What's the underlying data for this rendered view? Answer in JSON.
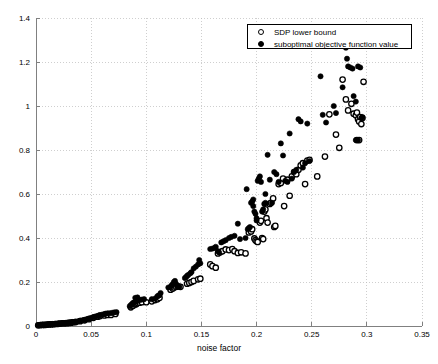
{
  "chart": {
    "type": "scatter",
    "title": "",
    "xlabel": "noise factor",
    "ylabel": "",
    "xlim": [
      0,
      0.35
    ],
    "ylim": [
      0,
      1.4
    ],
    "xticks": [
      "0",
      "0.05",
      "0.1",
      "0.15",
      "0.2",
      "0.25",
      "0.3",
      "0.35"
    ],
    "xtick_values": [
      0,
      0.05,
      0.1,
      0.15,
      0.2,
      0.25,
      0.3,
      0.35
    ],
    "yticks": [
      "0",
      "0.2",
      "0.4",
      "0.6",
      "0.8",
      "1",
      "1.2",
      "1.4"
    ],
    "ytick_values": [
      0,
      0.2,
      0.4,
      0.6,
      0.8,
      1,
      1.2,
      1.4
    ],
    "grid": true,
    "grid_style": "dotted",
    "grid_color": "#bbbbbb",
    "axis_color": "#808080",
    "marker_color": "#000000",
    "legend_position": "top-right"
  },
  "legend": {
    "items": [
      {
        "label": "SDP lower bound",
        "marker": "open-circle"
      },
      {
        "label": "suboptimal objective function value",
        "marker": "filled-circle"
      }
    ]
  },
  "chart_data": {
    "type": "scatter",
    "title": "",
    "xlabel": "noise factor",
    "ylabel": "",
    "xlim": [
      0,
      0.35
    ],
    "ylim": [
      0,
      1.4
    ],
    "xticks": [
      0,
      0.05,
      0.1,
      0.15,
      0.2,
      0.25,
      0.3,
      0.35
    ],
    "yticks": [
      0,
      0.2,
      0.4,
      0.6,
      0.8,
      1,
      1.2,
      1.4
    ],
    "grid": true,
    "legend_position": "top-right",
    "series": [
      {
        "name": "suboptimal objective function value",
        "marker": "filled-circle",
        "color": "#000000",
        "points": [
          [
            0.002,
            0.004
          ],
          [
            0.004,
            0.005
          ],
          [
            0.006,
            0.006
          ],
          [
            0.008,
            0.006
          ],
          [
            0.01,
            0.007
          ],
          [
            0.012,
            0.008
          ],
          [
            0.013,
            0.008
          ],
          [
            0.015,
            0.009
          ],
          [
            0.017,
            0.01
          ],
          [
            0.018,
            0.01
          ],
          [
            0.02,
            0.011
          ],
          [
            0.021,
            0.012
          ],
          [
            0.023,
            0.012
          ],
          [
            0.024,
            0.013
          ],
          [
            0.026,
            0.013
          ],
          [
            0.027,
            0.014
          ],
          [
            0.029,
            0.015
          ],
          [
            0.03,
            0.016
          ],
          [
            0.032,
            0.017
          ],
          [
            0.033,
            0.018
          ],
          [
            0.035,
            0.019
          ],
          [
            0.036,
            0.02
          ],
          [
            0.038,
            0.021
          ],
          [
            0.04,
            0.024
          ],
          [
            0.042,
            0.026
          ],
          [
            0.044,
            0.028
          ],
          [
            0.046,
            0.031
          ],
          [
            0.048,
            0.034
          ],
          [
            0.05,
            0.037
          ],
          [
            0.052,
            0.04
          ],
          [
            0.053,
            0.042
          ],
          [
            0.055,
            0.045
          ],
          [
            0.057,
            0.048
          ],
          [
            0.058,
            0.05
          ],
          [
            0.06,
            0.052
          ],
          [
            0.062,
            0.054
          ],
          [
            0.063,
            0.056
          ],
          [
            0.065,
            0.058
          ],
          [
            0.067,
            0.058
          ],
          [
            0.069,
            0.06
          ],
          [
            0.071,
            0.062
          ],
          [
            0.073,
            0.063
          ],
          [
            0.085,
            0.09
          ],
          [
            0.086,
            0.095
          ],
          [
            0.087,
            0.1
          ],
          [
            0.088,
            0.105
          ],
          [
            0.089,
            0.107
          ],
          [
            0.09,
            0.11
          ],
          [
            0.091,
            0.112
          ],
          [
            0.092,
            0.115
          ],
          [
            0.09,
            0.128
          ],
          [
            0.092,
            0.13
          ],
          [
            0.094,
            0.118
          ],
          [
            0.096,
            0.12
          ],
          [
            0.098,
            0.122
          ],
          [
            0.105,
            0.122
          ],
          [
            0.108,
            0.125
          ],
          [
            0.11,
            0.135
          ],
          [
            0.111,
            0.138
          ],
          [
            0.112,
            0.14
          ],
          [
            0.113,
            0.15
          ],
          [
            0.12,
            0.175
          ],
          [
            0.122,
            0.178
          ],
          [
            0.123,
            0.185
          ],
          [
            0.124,
            0.19
          ],
          [
            0.125,
            0.2
          ],
          [
            0.126,
            0.205
          ],
          [
            0.127,
            0.192
          ],
          [
            0.128,
            0.18
          ],
          [
            0.13,
            0.178
          ],
          [
            0.135,
            0.218
          ],
          [
            0.136,
            0.222
          ],
          [
            0.137,
            0.228
          ],
          [
            0.138,
            0.232
          ],
          [
            0.14,
            0.24
          ],
          [
            0.141,
            0.245
          ],
          [
            0.143,
            0.262
          ],
          [
            0.145,
            0.27
          ],
          [
            0.147,
            0.28
          ],
          [
            0.149,
            0.285
          ],
          [
            0.148,
            0.3
          ],
          [
            0.158,
            0.35
          ],
          [
            0.16,
            0.352
          ],
          [
            0.162,
            0.355
          ],
          [
            0.163,
            0.36
          ],
          [
            0.165,
            0.34
          ],
          [
            0.166,
            0.335
          ],
          [
            0.168,
            0.38
          ],
          [
            0.17,
            0.385
          ],
          [
            0.172,
            0.39
          ],
          [
            0.175,
            0.4
          ],
          [
            0.177,
            0.405
          ],
          [
            0.18,
            0.41
          ],
          [
            0.183,
            0.465
          ],
          [
            0.185,
            0.395
          ],
          [
            0.19,
            0.4
          ],
          [
            0.191,
            0.622
          ],
          [
            0.192,
            0.44
          ],
          [
            0.193,
            0.445
          ],
          [
            0.194,
            0.45
          ],
          [
            0.195,
            0.56
          ],
          [
            0.196,
            0.565
          ],
          [
            0.197,
            0.575
          ],
          [
            0.197,
            0.545
          ],
          [
            0.198,
            0.52
          ],
          [
            0.199,
            0.51
          ],
          [
            0.2,
            0.48
          ],
          [
            0.2,
            0.49
          ],
          [
            0.201,
            0.66
          ],
          [
            0.202,
            0.67
          ],
          [
            0.203,
            0.68
          ],
          [
            0.204,
            0.655
          ],
          [
            0.205,
            0.52
          ],
          [
            0.206,
            0.53
          ],
          [
            0.207,
            0.555
          ],
          [
            0.208,
            0.56
          ],
          [
            0.208,
            0.6
          ],
          [
            0.21,
            0.778
          ],
          [
            0.212,
            0.665
          ],
          [
            0.214,
            0.56
          ],
          [
            0.216,
            0.7
          ],
          [
            0.218,
            0.69
          ],
          [
            0.22,
            0.655
          ],
          [
            0.222,
            0.83
          ],
          [
            0.224,
            0.775
          ],
          [
            0.226,
            0.66
          ],
          [
            0.228,
            0.655
          ],
          [
            0.23,
            0.875
          ],
          [
            0.232,
            0.67
          ],
          [
            0.234,
            0.7
          ],
          [
            0.236,
            0.71
          ],
          [
            0.238,
            0.94
          ],
          [
            0.24,
            0.93
          ],
          [
            0.242,
            0.72
          ],
          [
            0.244,
            0.74
          ],
          [
            0.246,
            0.92
          ],
          [
            0.248,
            0.75
          ],
          [
            0.258,
            1.135
          ],
          [
            0.26,
            0.96
          ],
          [
            0.263,
            0.925
          ],
          [
            0.27,
            1.0
          ],
          [
            0.272,
            0.968
          ],
          [
            0.278,
            1.085
          ],
          [
            0.281,
            1.265
          ],
          [
            0.282,
            1.215
          ],
          [
            0.283,
            1.18
          ],
          [
            0.285,
            1.175
          ],
          [
            0.287,
            1.17
          ],
          [
            0.288,
            1.045
          ],
          [
            0.29,
            1.02
          ],
          [
            0.292,
            1.18
          ],
          [
            0.294,
            1.175
          ],
          [
            0.295,
            0.945
          ],
          [
            0.296,
            0.95
          ],
          [
            0.29,
            0.845
          ],
          [
            0.292,
            0.845
          ]
        ]
      },
      {
        "name": "SDP lower bound",
        "marker": "open-circle",
        "color": "#000000",
        "points": [
          [
            0.002,
            0.003
          ],
          [
            0.004,
            0.004
          ],
          [
            0.006,
            0.005
          ],
          [
            0.008,
            0.005
          ],
          [
            0.01,
            0.006
          ],
          [
            0.012,
            0.007
          ],
          [
            0.014,
            0.007
          ],
          [
            0.016,
            0.008
          ],
          [
            0.018,
            0.009
          ],
          [
            0.02,
            0.01
          ],
          [
            0.022,
            0.011
          ],
          [
            0.024,
            0.012
          ],
          [
            0.026,
            0.012
          ],
          [
            0.028,
            0.013
          ],
          [
            0.03,
            0.014
          ],
          [
            0.032,
            0.015
          ],
          [
            0.034,
            0.017
          ],
          [
            0.036,
            0.018
          ],
          [
            0.04,
            0.022
          ],
          [
            0.044,
            0.026
          ],
          [
            0.048,
            0.031
          ],
          [
            0.052,
            0.037
          ],
          [
            0.056,
            0.042
          ],
          [
            0.058,
            0.045
          ],
          [
            0.062,
            0.048
          ],
          [
            0.065,
            0.05
          ],
          [
            0.068,
            0.05
          ],
          [
            0.072,
            0.055
          ],
          [
            0.086,
            0.085
          ],
          [
            0.088,
            0.092
          ],
          [
            0.09,
            0.098
          ],
          [
            0.091,
            0.1
          ],
          [
            0.092,
            0.104
          ],
          [
            0.094,
            0.106
          ],
          [
            0.096,
            0.108
          ],
          [
            0.1,
            0.108
          ],
          [
            0.105,
            0.112
          ],
          [
            0.108,
            0.118
          ],
          [
            0.11,
            0.122
          ],
          [
            0.112,
            0.128
          ],
          [
            0.122,
            0.165
          ],
          [
            0.124,
            0.17
          ],
          [
            0.125,
            0.175
          ],
          [
            0.127,
            0.178
          ],
          [
            0.129,
            0.18
          ],
          [
            0.131,
            0.178
          ],
          [
            0.137,
            0.192
          ],
          [
            0.139,
            0.196
          ],
          [
            0.141,
            0.2
          ],
          [
            0.143,
            0.205
          ],
          [
            0.147,
            0.212
          ],
          [
            0.149,
            0.215
          ],
          [
            0.158,
            0.28
          ],
          [
            0.16,
            0.272
          ],
          [
            0.163,
            0.265
          ],
          [
            0.165,
            0.33
          ],
          [
            0.167,
            0.335
          ],
          [
            0.169,
            0.34
          ],
          [
            0.172,
            0.348
          ],
          [
            0.175,
            0.345
          ],
          [
            0.178,
            0.35
          ],
          [
            0.18,
            0.34
          ],
          [
            0.183,
            0.332
          ],
          [
            0.186,
            0.335
          ],
          [
            0.19,
            0.33
          ],
          [
            0.193,
            0.425
          ],
          [
            0.195,
            0.43
          ],
          [
            0.196,
            0.44
          ],
          [
            0.198,
            0.398
          ],
          [
            0.199,
            0.39
          ],
          [
            0.2,
            0.385
          ],
          [
            0.201,
            0.382
          ],
          [
            0.203,
            0.47
          ],
          [
            0.204,
            0.478
          ],
          [
            0.205,
            0.4
          ],
          [
            0.206,
            0.395
          ],
          [
            0.207,
            0.52
          ],
          [
            0.208,
            0.53
          ],
          [
            0.209,
            0.49
          ],
          [
            0.21,
            0.47
          ],
          [
            0.212,
            0.555
          ],
          [
            0.213,
            0.56
          ],
          [
            0.215,
            0.58
          ],
          [
            0.216,
            0.45
          ],
          [
            0.217,
            0.455
          ],
          [
            0.22,
            0.645
          ],
          [
            0.222,
            0.65
          ],
          [
            0.224,
            0.67
          ],
          [
            0.225,
            0.545
          ],
          [
            0.228,
            0.665
          ],
          [
            0.23,
            0.592
          ],
          [
            0.232,
            0.68
          ],
          [
            0.234,
            0.7
          ],
          [
            0.236,
            0.69
          ],
          [
            0.238,
            0.71
          ],
          [
            0.24,
            0.73
          ],
          [
            0.242,
            0.74
          ],
          [
            0.244,
            0.645
          ],
          [
            0.246,
            0.752
          ],
          [
            0.248,
            0.755
          ],
          [
            0.255,
            0.68
          ],
          [
            0.262,
            0.77
          ],
          [
            0.266,
            0.962
          ],
          [
            0.272,
            0.87
          ],
          [
            0.275,
            0.81
          ],
          [
            0.278,
            1.12
          ],
          [
            0.281,
            1.03
          ],
          [
            0.283,
            0.98
          ],
          [
            0.286,
            1.01
          ],
          [
            0.288,
            0.965
          ],
          [
            0.29,
            0.958
          ],
          [
            0.291,
            0.97
          ],
          [
            0.292,
            0.94
          ],
          [
            0.293,
            0.93
          ],
          [
            0.294,
            0.95
          ],
          [
            0.295,
            0.918
          ],
          [
            0.296,
            0.945
          ],
          [
            0.297,
            1.11
          ],
          [
            0.291,
            0.845
          ],
          [
            0.293,
            0.845
          ]
        ]
      }
    ]
  }
}
